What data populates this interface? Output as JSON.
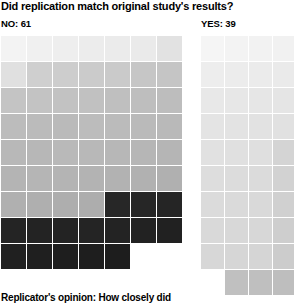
{
  "chart": {
    "title": "Did replication match original study's results?",
    "footer_note": "Replicator's opinion: How closely did"
  },
  "groups": {
    "no": {
      "label": "NO: 61",
      "count": 61
    },
    "yes": {
      "label": "YES: 39",
      "count": 39
    }
  },
  "chart_data": {
    "type": "table",
    "title": "Did replication match original study's results?",
    "subtitle": "Replicator's opinion: How closely did",
    "xlabel": "",
    "ylabel": "",
    "legend_position": "none",
    "grid": false,
    "categories": [
      "NO",
      "YES"
    ],
    "values": [
      61,
      39
    ],
    "total": 100,
    "unit": "studies",
    "note": "Waffle grid: one square per study, shaded by replicator's rating of how closely the replication matched the original result (light = closest match, dark = least match).",
    "series": [
      {
        "name": "NO",
        "label": "NO: 61",
        "count": 61,
        "columns": 7,
        "cell_colors": [
          "#f3f3f3",
          "#f0f0f0",
          "#eeeeee",
          "#ececec",
          "#ebebeb",
          "#eaeaea",
          "#e2e2e2",
          "#e0e0e0",
          "#cfcfcf",
          "#cdcdcd",
          "#cbcbcb",
          "#cacaca",
          "#c6c6c6",
          "#c5c5c5",
          "#c4c4c4",
          "#c3c3c3",
          "#c2c2c2",
          "#c1c1c1",
          "#bfbfbf",
          "#bebebe",
          "#bdbdbd",
          "#bcbcbc",
          "#bbbbbb",
          "#bababa",
          "#bcbcbc",
          "#bbbbbb",
          "#bababa",
          "#b9b9b9",
          "#b8b8b8",
          "#b7b7b7",
          "#b9b9b9",
          "#b8b8b8",
          "#b7b7b7",
          "#b6b6b6",
          "#b5b5b5",
          "#b4b4b4",
          "#b5b5b5",
          "#b4b4b4",
          "#b3b3b3",
          "#b2b2b2",
          "#b1b1b1",
          "#b0b0b0",
          "#b0b0b0",
          "#afafaf",
          "#aeaeae",
          "#adadad",
          "#272727",
          "#262626",
          "#252525",
          "#242424",
          "#232323",
          "#232323",
          "#242424",
          "#232323",
          "#222222",
          "#212121",
          "#202020",
          "#1f1f1f",
          "#1e1e1e",
          "#1e1e1e",
          "#1d1d1d"
        ]
      },
      {
        "name": "YES",
        "label": "YES: 39",
        "count": 39,
        "columns": 4,
        "cell_colors": [
          "#f5f5f5",
          "#f3f3f3",
          "#f2f2f2",
          "#f1f1f1",
          "#ededed",
          "#ececec",
          "#ebebeb",
          "#eaeaea",
          "#e8e8e8",
          "#e7e7e7",
          "#e6e6e6",
          "#e5e5e5",
          "#e4e4e4",
          "#e3e3e3",
          "#e2e2e2",
          "#e1e1e1",
          "#e1e1e1",
          "#e0e0e0",
          "#dfdfdf",
          "#d4d4d4",
          "#dddddd",
          "#dcdcdc",
          "#dbdbdb",
          "#d2d2d2",
          "#dbdbdb",
          "#dadada",
          "#d9d9d9",
          "#d0d0d0",
          "#d9d9d9",
          "#d8d8d8",
          "#d7d7d7",
          "#cecece",
          "#d7d7d7",
          "#d6d6d6",
          "#d5d5d5",
          "#cccccc",
          "#c0c0c0",
          "#bfbfbf",
          "#bebebe"
        ],
        "offsets": {
          "last_row_start_column": 2
        }
      }
    ]
  },
  "colors": {
    "text": "#000000",
    "background": "#ffffff",
    "scale_light": "#f5f5f5",
    "scale_dark": "#1d1d1d"
  }
}
